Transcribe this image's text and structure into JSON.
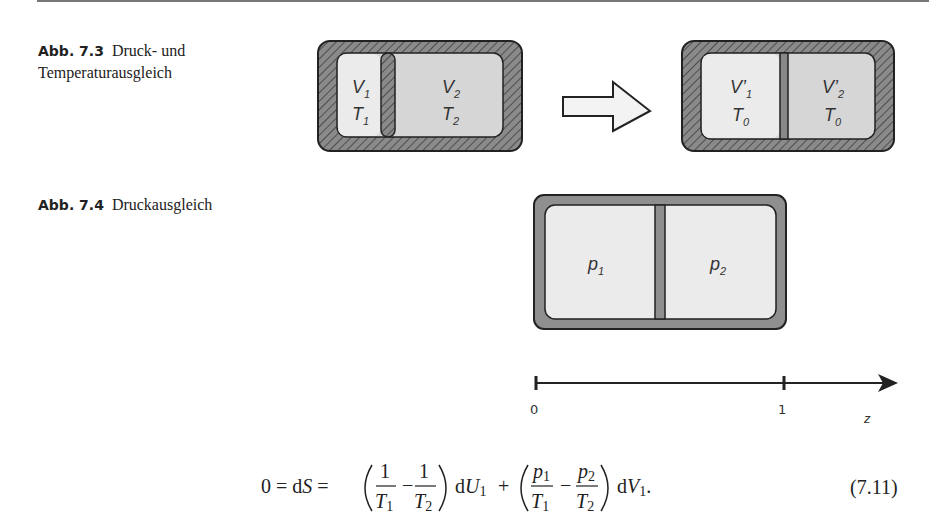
{
  "figures": [
    {
      "label": "Abb. 7.3",
      "caption_line1": "Druck- und",
      "caption_line2": "Temperaturausgleich",
      "before": {
        "v": "V",
        "v_sub": "1",
        "t": "T",
        "t_sub": "1",
        "v2": "V",
        "v2_sub": "2",
        "t2": "T",
        "t2_sub": "2"
      },
      "after": {
        "v1": "V'",
        "v1_sub": "1",
        "t1": "T",
        "t1_sub": "0",
        "v2": "V'",
        "v2_sub": "2",
        "t2": "T",
        "t2_sub": "0"
      }
    },
    {
      "label": "Abb. 7.4",
      "caption_line1": "Druckausgleich",
      "left": {
        "p": "p",
        "p_sub": "1"
      },
      "right": {
        "p": "p",
        "p_sub": "2"
      },
      "axis": {
        "tick0": "0",
        "tick1": "1",
        "var": "z"
      }
    }
  ],
  "equation": {
    "lhs": "0 = dS = ",
    "number": "(7.11)"
  }
}
